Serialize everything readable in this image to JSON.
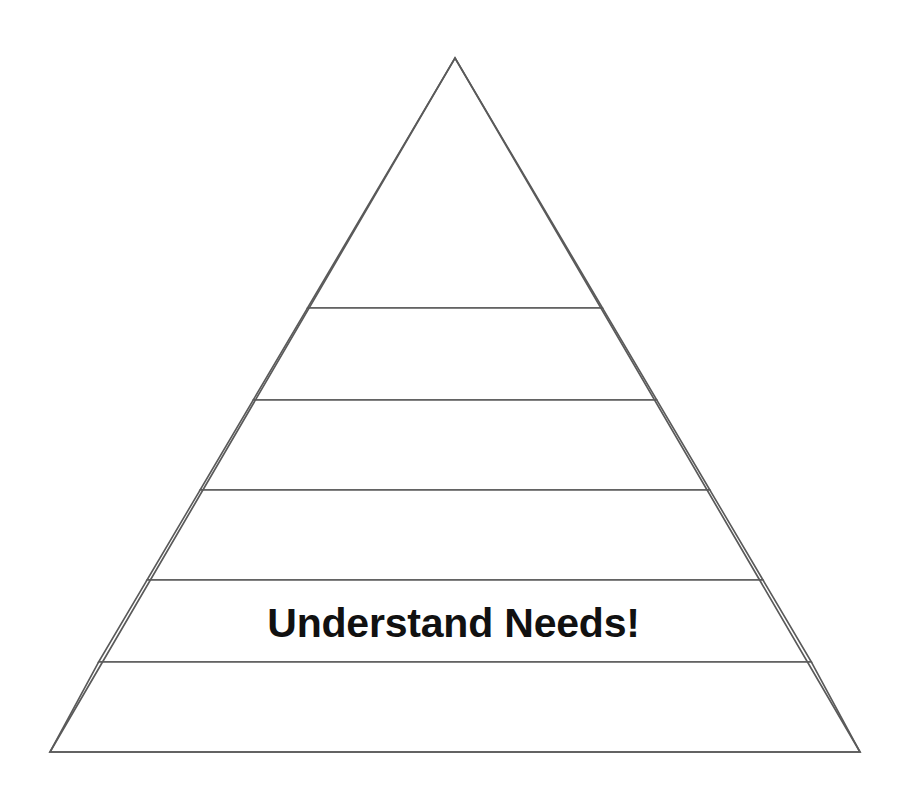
{
  "diagram": {
    "type": "pyramid",
    "title": "",
    "background_color": "#ffffff",
    "outline_color": "#5a5a5a",
    "fill_color": "#ffffff",
    "label_color": "#111111",
    "level_count": 6,
    "levels": [
      {
        "index": 1,
        "position": "top",
        "label": ""
      },
      {
        "index": 2,
        "position": "second",
        "label": ""
      },
      {
        "index": 3,
        "position": "third",
        "label": ""
      },
      {
        "index": 4,
        "position": "fourth",
        "label": ""
      },
      {
        "index": 5,
        "position": "fifth",
        "label": "Understand Needs!"
      },
      {
        "index": 6,
        "position": "bottom",
        "label": ""
      }
    ],
    "geometry": {
      "apex": [
        455,
        58
      ],
      "base_left": [
        50,
        752
      ],
      "base_right": [
        860,
        752
      ],
      "divider_y": [
        308,
        400,
        490,
        580,
        662
      ]
    }
  },
  "caption": {
    "clipped_text": "",
    "note": "cut off at page edge"
  }
}
